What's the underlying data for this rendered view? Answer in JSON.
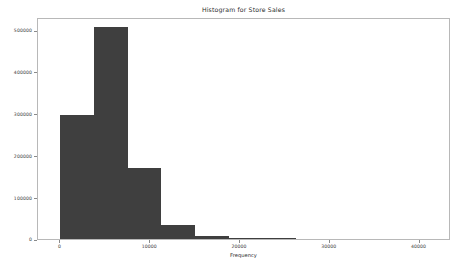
{
  "chart_data": {
    "type": "bar",
    "title": "Histogram for Store Sales",
    "xlabel": "Frequency",
    "ylabel": "",
    "xlim": [
      -2500,
      43500
    ],
    "ylim": [
      0,
      530000
    ],
    "grid": false,
    "legend": null,
    "bar_color": "#3f3f3f",
    "xticks": [
      0,
      10000,
      20000,
      30000,
      40000
    ],
    "xtick_labels": [
      "0",
      "10000",
      "20000",
      "30000",
      "40000"
    ],
    "yticks": [
      0,
      100000,
      200000,
      300000,
      400000,
      500000
    ],
    "ytick_labels": [
      "0",
      "100000",
      "200000",
      "300000",
      "400000",
      "500000"
    ],
    "bin_width": 3750,
    "bins": [
      {
        "start": 0,
        "end": 3750,
        "count": 295000
      },
      {
        "start": 3750,
        "end": 7500,
        "count": 505000
      },
      {
        "start": 7500,
        "end": 11250,
        "count": 170000
      },
      {
        "start": 11250,
        "end": 15000,
        "count": 33000
      },
      {
        "start": 15000,
        "end": 18750,
        "count": 8000
      },
      {
        "start": 18750,
        "end": 22500,
        "count": 2000
      },
      {
        "start": 22500,
        "end": 26250,
        "count": 600
      },
      {
        "start": 26250,
        "end": 30000,
        "count": 0
      },
      {
        "start": 30000,
        "end": 33750,
        "count": 0
      },
      {
        "start": 33750,
        "end": 37500,
        "count": 0
      },
      {
        "start": 37500,
        "end": 41250,
        "count": 0
      },
      {
        "start": 41250,
        "end": 45000,
        "count": 0
      }
    ]
  }
}
